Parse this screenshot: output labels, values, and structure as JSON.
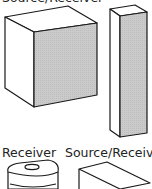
{
  "labels": {
    "top": "Source/Receiver",
    "bottom_left": "Receiver",
    "bottom_right": "Source/Receiver"
  },
  "colors": {
    "stroke": "#1a1a1a",
    "shaded_face": "#c9c9c9",
    "background": "#ffffff"
  },
  "objects": [
    {
      "name": "large-box",
      "type": "cuboid",
      "shaded_face": "front"
    },
    {
      "name": "tall-column",
      "type": "cuboid",
      "shaded_face": "front"
    },
    {
      "name": "cylinder-receiver",
      "type": "cylinder"
    },
    {
      "name": "wedge-box",
      "type": "cuboid"
    }
  ]
}
